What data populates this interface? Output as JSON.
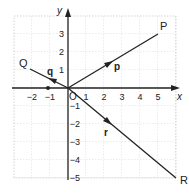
{
  "axes": {
    "x_label": "x",
    "y_label": "y",
    "origin_label": "O",
    "x_ticks": [
      "−2",
      "−1",
      "1",
      "2",
      "3",
      "4",
      "5"
    ],
    "y_ticks": [
      "3",
      "2",
      "1",
      "−1",
      "−2",
      "−3",
      "−4",
      "−5"
    ]
  },
  "points": {
    "P": "P",
    "Q": "Q",
    "R": "R"
  },
  "vectors": {
    "p": "p",
    "q": "q",
    "r": "r"
  },
  "colors": {
    "line": "#222222",
    "grid": "#bbbbbb"
  }
}
